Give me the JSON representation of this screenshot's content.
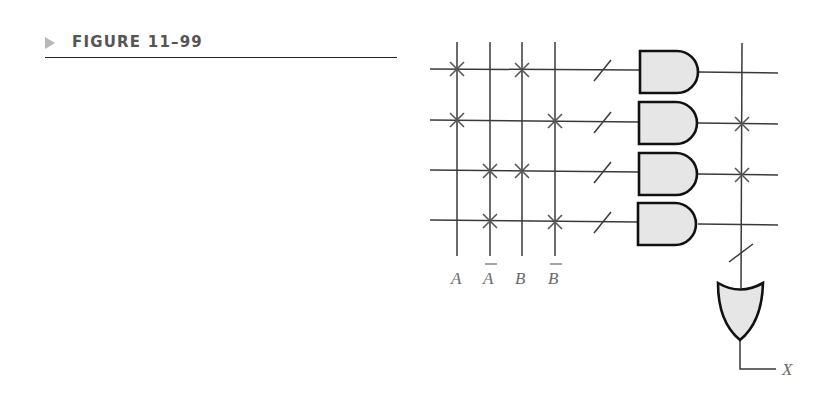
{
  "figure": {
    "label": "FIGURE 11–99",
    "marker_icon": "triangle-right-icon"
  },
  "diagram": {
    "type": "programmable-and-array",
    "input_lines": [
      {
        "label": "A",
        "complement": false
      },
      {
        "label": "A",
        "complement": true
      },
      {
        "label": "B",
        "complement": false
      },
      {
        "label": "B",
        "complement": true
      }
    ],
    "product_terms": [
      {
        "row": 1,
        "connections": [
          "A",
          "B"
        ]
      },
      {
        "row": 2,
        "connections": [
          "A",
          "B̄"
        ]
      },
      {
        "row": 3,
        "connections": [
          "Ā",
          "B"
        ]
      },
      {
        "row": 4,
        "connections": [
          "Ā",
          "B̄"
        ]
      }
    ],
    "or_input_connections": [
      {
        "row": 1,
        "connected": false
      },
      {
        "row": 2,
        "connected": true
      },
      {
        "row": 3,
        "connected": true
      },
      {
        "row": 4,
        "connected": false
      }
    ],
    "gates": {
      "and_count": 4,
      "or_count": 1
    },
    "output_label": "X",
    "colors": {
      "line": "#3a3a3a",
      "gate_fill": "#e6e6e6",
      "gate_stroke": "#111111",
      "fuse_mark": "#555555",
      "label": "#6a6a6a"
    }
  }
}
